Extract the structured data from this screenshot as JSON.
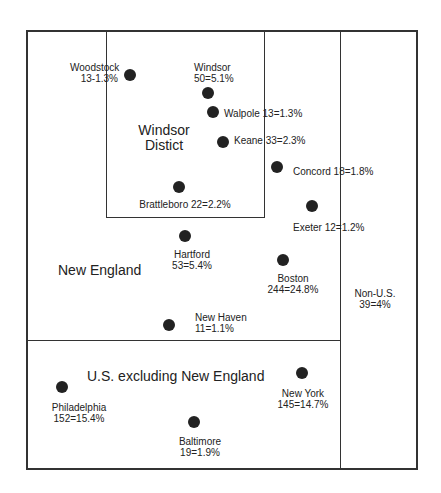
{
  "diagram": {
    "regions": {
      "windsor_district": {
        "line1": "Windsor",
        "line2": "Distict"
      },
      "new_england": "New England",
      "us_excluding_ne": "U.S. excluding New England",
      "non_us": {
        "line1": "Non-U.S.",
        "line2": "39=4%"
      }
    },
    "locations": [
      {
        "name": "Woodstock",
        "value": "13-1.3%"
      },
      {
        "name": "Windsor",
        "value": "50=5.1%"
      },
      {
        "name": "Walpole",
        "label": "Walpole 13=1.3%"
      },
      {
        "name": "Keane",
        "label": "Keane 33=2.3%"
      },
      {
        "name": "Concord",
        "label": "Concord 18=1.8%"
      },
      {
        "name": "Brattleboro",
        "label": "Brattleboro 22=2.2%"
      },
      {
        "name": "Exeter",
        "label": "Exeter 12=1.2%"
      },
      {
        "name": "Hartford",
        "value": "53=5.4%"
      },
      {
        "name": "Boston",
        "value": "244=24.8%"
      },
      {
        "name": "New Haven",
        "value": "11=1.1%"
      },
      {
        "name": "Philadelphia",
        "value": "152=15.4%"
      },
      {
        "name": "New York",
        "value": "145=14.7%"
      },
      {
        "name": "Baltimore",
        "value": "19=1.9%"
      }
    ]
  }
}
